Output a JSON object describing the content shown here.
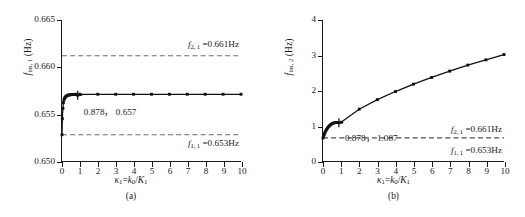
{
  "figure": {
    "panels": [
      {
        "id": "a",
        "subcaption": "(a)",
        "xlabel_html": "<span class=\"it\">κ</span><sub>1</sub>=<span class=\"it\">k</span><sub>0</sub>/<span class=\"it\">K</span><sub>1</sub>",
        "ylabel_html": "<span class=\"it\">f</span><sub>im, 1</sub> (Hz)",
        "annotation": "0.878， 0.657",
        "reference_lines": [
          {
            "label_html": "<span class=\"it\">f</span><sub>2, 1</sub> =0.661Hz",
            "value": 0.6612
          },
          {
            "label_html": "<span class=\"it\">f</span><sub>1, 1</sub> =0.653Hz",
            "value": 0.6528
          }
        ],
        "ytick_labels": [
          "0.650",
          "0.655",
          "0.660",
          "0.665"
        ],
        "xtick_labels": [
          "0",
          "1",
          "2",
          "3",
          "4",
          "5",
          "6",
          "7",
          "8",
          "9",
          "10"
        ]
      },
      {
        "id": "b",
        "subcaption": "(b)",
        "xlabel_html": "<span class=\"it\">κ</span><sub>1</sub>=<span class=\"it\">k</span><sub>0</sub>/<span class=\"it\">K</span><sub>1</sub>",
        "ylabel_html": "<span class=\"it\">f</span><sub>im, 2</sub> (Hz)",
        "annotation": "0.878， 1.087",
        "reference_lines": [
          {
            "label_html": "<span class=\"it\">f</span><sub>2, 1</sub> =0.661Hz",
            "value": 0.661
          },
          {
            "label_html": "<span class=\"it\">f</span><sub>1, 1</sub> =0.653Hz",
            "value": 0.653
          }
        ],
        "ytick_labels": [
          "0",
          "1",
          "2",
          "3",
          "4"
        ],
        "xtick_labels": [
          "0",
          "1",
          "2",
          "3",
          "4",
          "5",
          "6",
          "7",
          "8",
          "9",
          "10"
        ]
      }
    ]
  },
  "chart_data": [
    {
      "type": "line",
      "panel": "a",
      "title": "",
      "xlabel": "κ1=k0/K1",
      "ylabel": "f_im,1 (Hz)",
      "xlim": [
        0,
        10
      ],
      "ylim": [
        0.65,
        0.665
      ],
      "xticks": [
        0,
        1,
        2,
        3,
        4,
        5,
        6,
        7,
        8,
        9,
        10
      ],
      "yticks": [
        0.65,
        0.655,
        0.66,
        0.665
      ],
      "grid": false,
      "legend": "none",
      "marker": "square",
      "series": [
        {
          "name": "f_im,1",
          "x": [
            0.0,
            0.02,
            0.05,
            0.08,
            0.11,
            0.14,
            0.17,
            0.2,
            0.24,
            0.28,
            0.33,
            0.38,
            0.44,
            0.5,
            0.57,
            0.64,
            0.72,
            0.8,
            0.878,
            1,
            2,
            3,
            4,
            5,
            6,
            7,
            8,
            9,
            10
          ],
          "y": [
            0.6528,
            0.6545,
            0.6556,
            0.6562,
            0.6565,
            0.65665,
            0.65675,
            0.65683,
            0.6569,
            0.65695,
            0.657,
            0.65702,
            0.65704,
            0.65706,
            0.65707,
            0.65708,
            0.65709,
            0.657095,
            0.657,
            0.6571,
            0.6571,
            0.6571,
            0.6571,
            0.6571,
            0.6571,
            0.6571,
            0.6571,
            0.6571,
            0.6571
          ]
        }
      ],
      "annotations": [
        {
          "text": "0.878， 0.657",
          "x": 0.878,
          "y": 0.657,
          "marker": "plus"
        }
      ],
      "reference_lines": [
        {
          "y": 0.6612,
          "style": "dashed",
          "label": "f_2,1 =0.661Hz"
        },
        {
          "y": 0.6528,
          "style": "dashed",
          "label": "f_1,1 =0.653Hz"
        }
      ]
    },
    {
      "type": "line",
      "panel": "b",
      "title": "",
      "xlabel": "κ1=k0/K1",
      "ylabel": "f_im,2 (Hz)",
      "xlim": [
        0,
        10
      ],
      "ylim": [
        0,
        4
      ],
      "xticks": [
        0,
        1,
        2,
        3,
        4,
        5,
        6,
        7,
        8,
        9,
        10
      ],
      "yticks": [
        0,
        1,
        2,
        3,
        4
      ],
      "grid": false,
      "legend": "none",
      "marker": "square",
      "series": [
        {
          "name": "f_im,2",
          "x": [
            0.0,
            0.03,
            0.06,
            0.09,
            0.12,
            0.16,
            0.2,
            0.25,
            0.3,
            0.35,
            0.41,
            0.47,
            0.54,
            0.61,
            0.69,
            0.77,
            0.878,
            1,
            2,
            3,
            4,
            5,
            6,
            7,
            8,
            9,
            10
          ],
          "y": [
            0.653,
            0.7,
            0.745,
            0.785,
            0.822,
            0.862,
            0.898,
            0.935,
            0.968,
            0.997,
            1.025,
            1.048,
            1.068,
            1.082,
            1.09,
            1.092,
            1.087,
            1.1,
            1.47,
            1.74,
            1.97,
            2.18,
            2.37,
            2.55,
            2.72,
            2.87,
            3.02
          ]
        }
      ],
      "annotations": [
        {
          "text": "0.878， 1.087",
          "x": 0.878,
          "y": 1.087,
          "marker": "plus"
        }
      ],
      "reference_lines": [
        {
          "y": 0.661,
          "style": "dashed",
          "label": "f_2,1 =0.661Hz"
        },
        {
          "y": 0.653,
          "style": "dashed",
          "label": "f_1,1 =0.653Hz"
        }
      ]
    }
  ]
}
